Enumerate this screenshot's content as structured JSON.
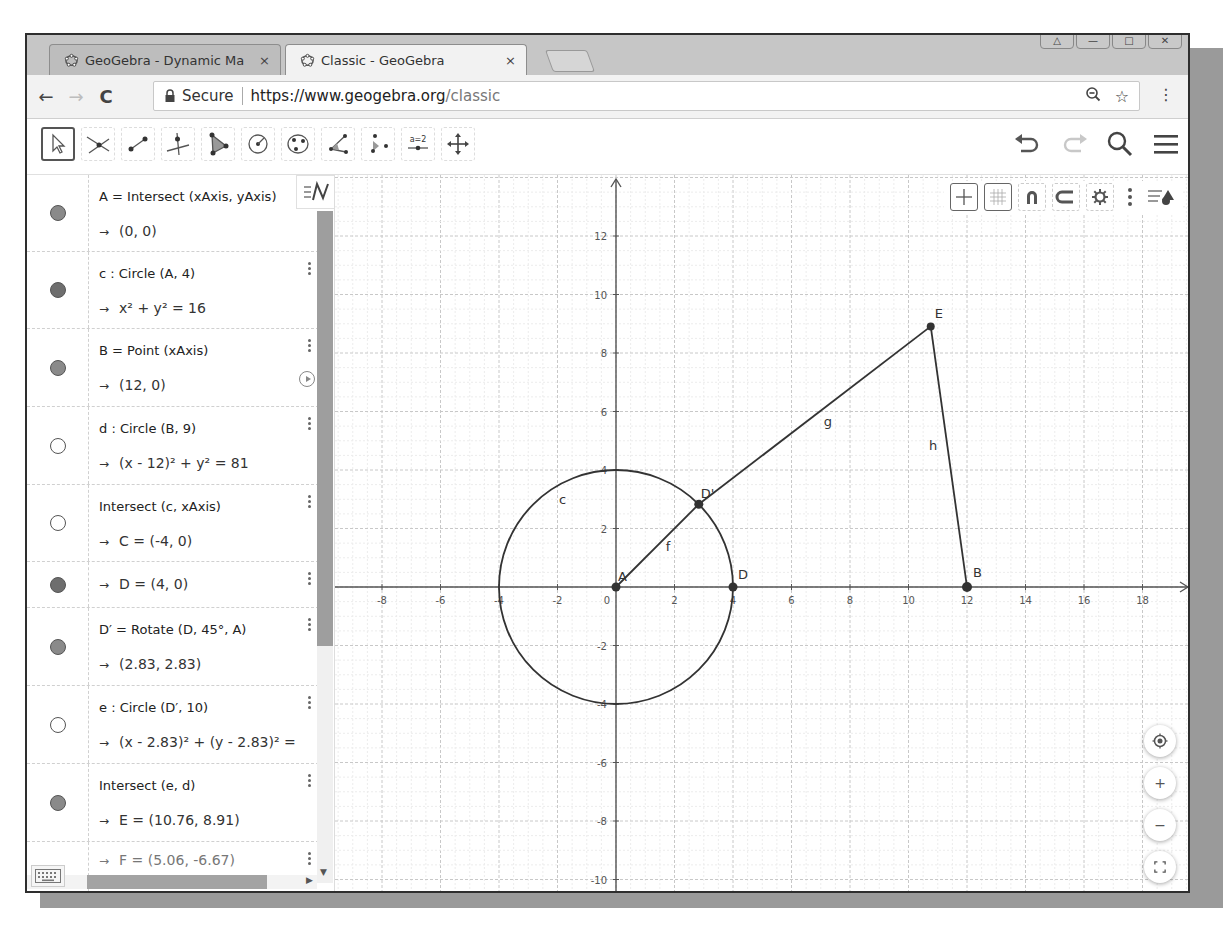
{
  "browser": {
    "tabs": [
      {
        "title": "GeoGebra - Dynamic Ma",
        "close": "×",
        "active": false
      },
      {
        "title": "Classic - GeoGebra",
        "close": "×",
        "active": true
      }
    ],
    "window_controls": [
      "user",
      "minimize",
      "maximize",
      "close"
    ],
    "secure_label": "Secure",
    "url_host": "https://www.geogebra.org",
    "url_path": "/classic",
    "back": "←",
    "forward": "→",
    "reload": "C"
  },
  "geogebra_toolbar": {
    "tools": [
      {
        "name": "move-tool",
        "selected": true
      },
      {
        "name": "intersect-tool"
      },
      {
        "name": "segment-tool"
      },
      {
        "name": "perpendicular-line-tool"
      },
      {
        "name": "polygon-tool"
      },
      {
        "name": "circle-center-point-tool"
      },
      {
        "name": "ellipse-tool"
      },
      {
        "name": "angle-tool"
      },
      {
        "name": "reflect-tool"
      },
      {
        "name": "slider-tool",
        "label": "a=2"
      },
      {
        "name": "move-graphics-view-tool"
      }
    ],
    "right": [
      "undo",
      "redo",
      "search",
      "menu"
    ]
  },
  "algebra": {
    "rows": [
      {
        "def": "A = Intersect (xAxis, yAxis)",
        "val": "(0, 0)",
        "marble": "on"
      },
      {
        "def": "c : Circle (A, 4)",
        "val": "x² + y² = 16",
        "marble": "on-dark"
      },
      {
        "def": "B = Point (xAxis)",
        "val": "(12, 0)",
        "marble": "on",
        "play": true
      },
      {
        "def": "d : Circle (B, 9)",
        "val": "(x - 12)² + y² = 81",
        "marble": "off"
      },
      {
        "def": "Intersect (c, xAxis)",
        "val": "C = (-4, 0)",
        "marble": "off"
      },
      {
        "def": "",
        "val": "D = (4, 0)",
        "marble": "on-dark"
      },
      {
        "def": "D′ = Rotate (D, 45°, A)",
        "val": "(2.83, 2.83)",
        "marble": "on"
      },
      {
        "def": "e : Circle (D′, 10)",
        "val": "(x - 2.83)² + (y - 2.83)² =",
        "marble": "off"
      },
      {
        "def": "Intersect (e, d)",
        "val": "E = (10.76, 8.91)",
        "marble": "on"
      },
      {
        "def": "",
        "val": "F = (5.06, -6.67)",
        "marble": "off",
        "partial": true
      }
    ],
    "arrow": "→",
    "style_button": "≡N"
  },
  "graphics": {
    "x_ticks": [
      "-8",
      "-6",
      "-4",
      "-2",
      "0",
      "2",
      "4",
      "6",
      "8",
      "10",
      "12",
      "14",
      "16",
      "18"
    ],
    "y_ticks": [
      "12",
      "10",
      "8",
      "6",
      "4",
      "2",
      "-2",
      "-4",
      "-6",
      "-8",
      "-10"
    ],
    "labels": {
      "A": "A",
      "B": "B",
      "D": "D",
      "Dp": "D'",
      "E": "E",
      "c": "c",
      "f": "f",
      "g": "g",
      "h": "h"
    },
    "points": {
      "A": [
        0,
        0
      ],
      "B": [
        12,
        0
      ],
      "D": [
        4,
        0
      ],
      "Dp": [
        2.83,
        2.83
      ],
      "E": [
        10.76,
        8.91
      ]
    },
    "circle_c": {
      "center": [
        0,
        0
      ],
      "radius": 4
    },
    "style_bar": [
      "axes-toggle",
      "grid-toggle",
      "point-capture",
      "view-options",
      "settings",
      "more",
      "toggle-style-bar"
    ],
    "zoom_buttons": [
      "home",
      "+",
      "−",
      "fullscreen"
    ]
  }
}
